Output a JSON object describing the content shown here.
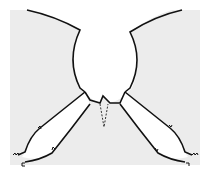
{
  "diagram": {
    "type": "sewing-pattern",
    "colors": {
      "background": "#ffffff",
      "fabric": "#ececec",
      "outline": "#111111"
    },
    "pieces": [
      {
        "name": "left-upper-panel"
      },
      {
        "name": "right-upper-panel"
      },
      {
        "name": "left-armhole-piece"
      },
      {
        "name": "right-armhole-piece"
      },
      {
        "name": "center-collar"
      }
    ],
    "marks": {
      "dart": "dashed-v",
      "notches": 4,
      "corner-stitches": 4
    }
  }
}
